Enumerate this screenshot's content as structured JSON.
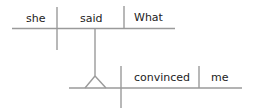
{
  "diagram": {
    "type": "sentence-diagram",
    "colors": {
      "line": "#9a9a9a",
      "text": "#222222"
    },
    "main_clause": {
      "subject": "she",
      "verb": "said",
      "object": "What"
    },
    "subordinate_clause": {
      "verb": "convinced",
      "object": "me"
    }
  }
}
